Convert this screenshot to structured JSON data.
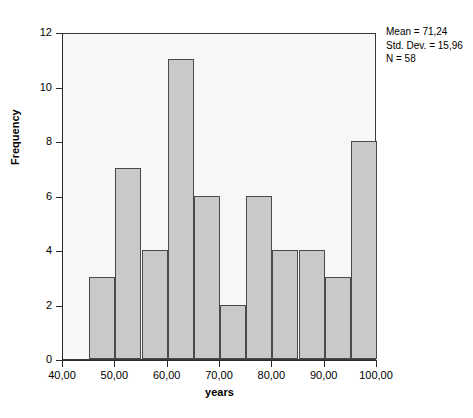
{
  "chart_data": {
    "type": "bar",
    "title": "",
    "xlabel": "years",
    "ylabel": "Frequency",
    "xlim": [
      40,
      100
    ],
    "ylim": [
      0,
      12
    ],
    "grid": false,
    "legend": null,
    "bin_width": 5,
    "bin_starts": [
      45,
      50,
      55,
      60,
      65,
      70,
      75,
      80,
      85,
      90,
      95
    ],
    "categories": [
      "45-50",
      "50-55",
      "55-60",
      "60-65",
      "65-70",
      "70-75",
      "75-80",
      "80-85",
      "85-90",
      "90-95",
      "95-100"
    ],
    "values": [
      3,
      7,
      4,
      11,
      6,
      2,
      6,
      4,
      4,
      3,
      8
    ],
    "x_ticks": [
      40,
      50,
      60,
      70,
      80,
      90,
      100
    ],
    "x_tick_labels": [
      "40,00",
      "50,00",
      "60,00",
      "70,00",
      "80,00",
      "90,00",
      "100,00"
    ],
    "y_ticks": [
      0,
      2,
      4,
      6,
      8,
      10,
      12
    ],
    "y_tick_labels": [
      "0",
      "2",
      "4",
      "6",
      "8",
      "10",
      "12"
    ],
    "annotations": {
      "mean": "Mean = 71,24",
      "std_dev": "Std. Dev. = 15,96",
      "n": "N = 58"
    },
    "colors": {
      "bar_fill": "#c9c9c9",
      "bar_border": "#4a4a4a",
      "plot_background": "#f7f7f5",
      "axis": "#2b2b2b",
      "text": "#000000"
    }
  }
}
